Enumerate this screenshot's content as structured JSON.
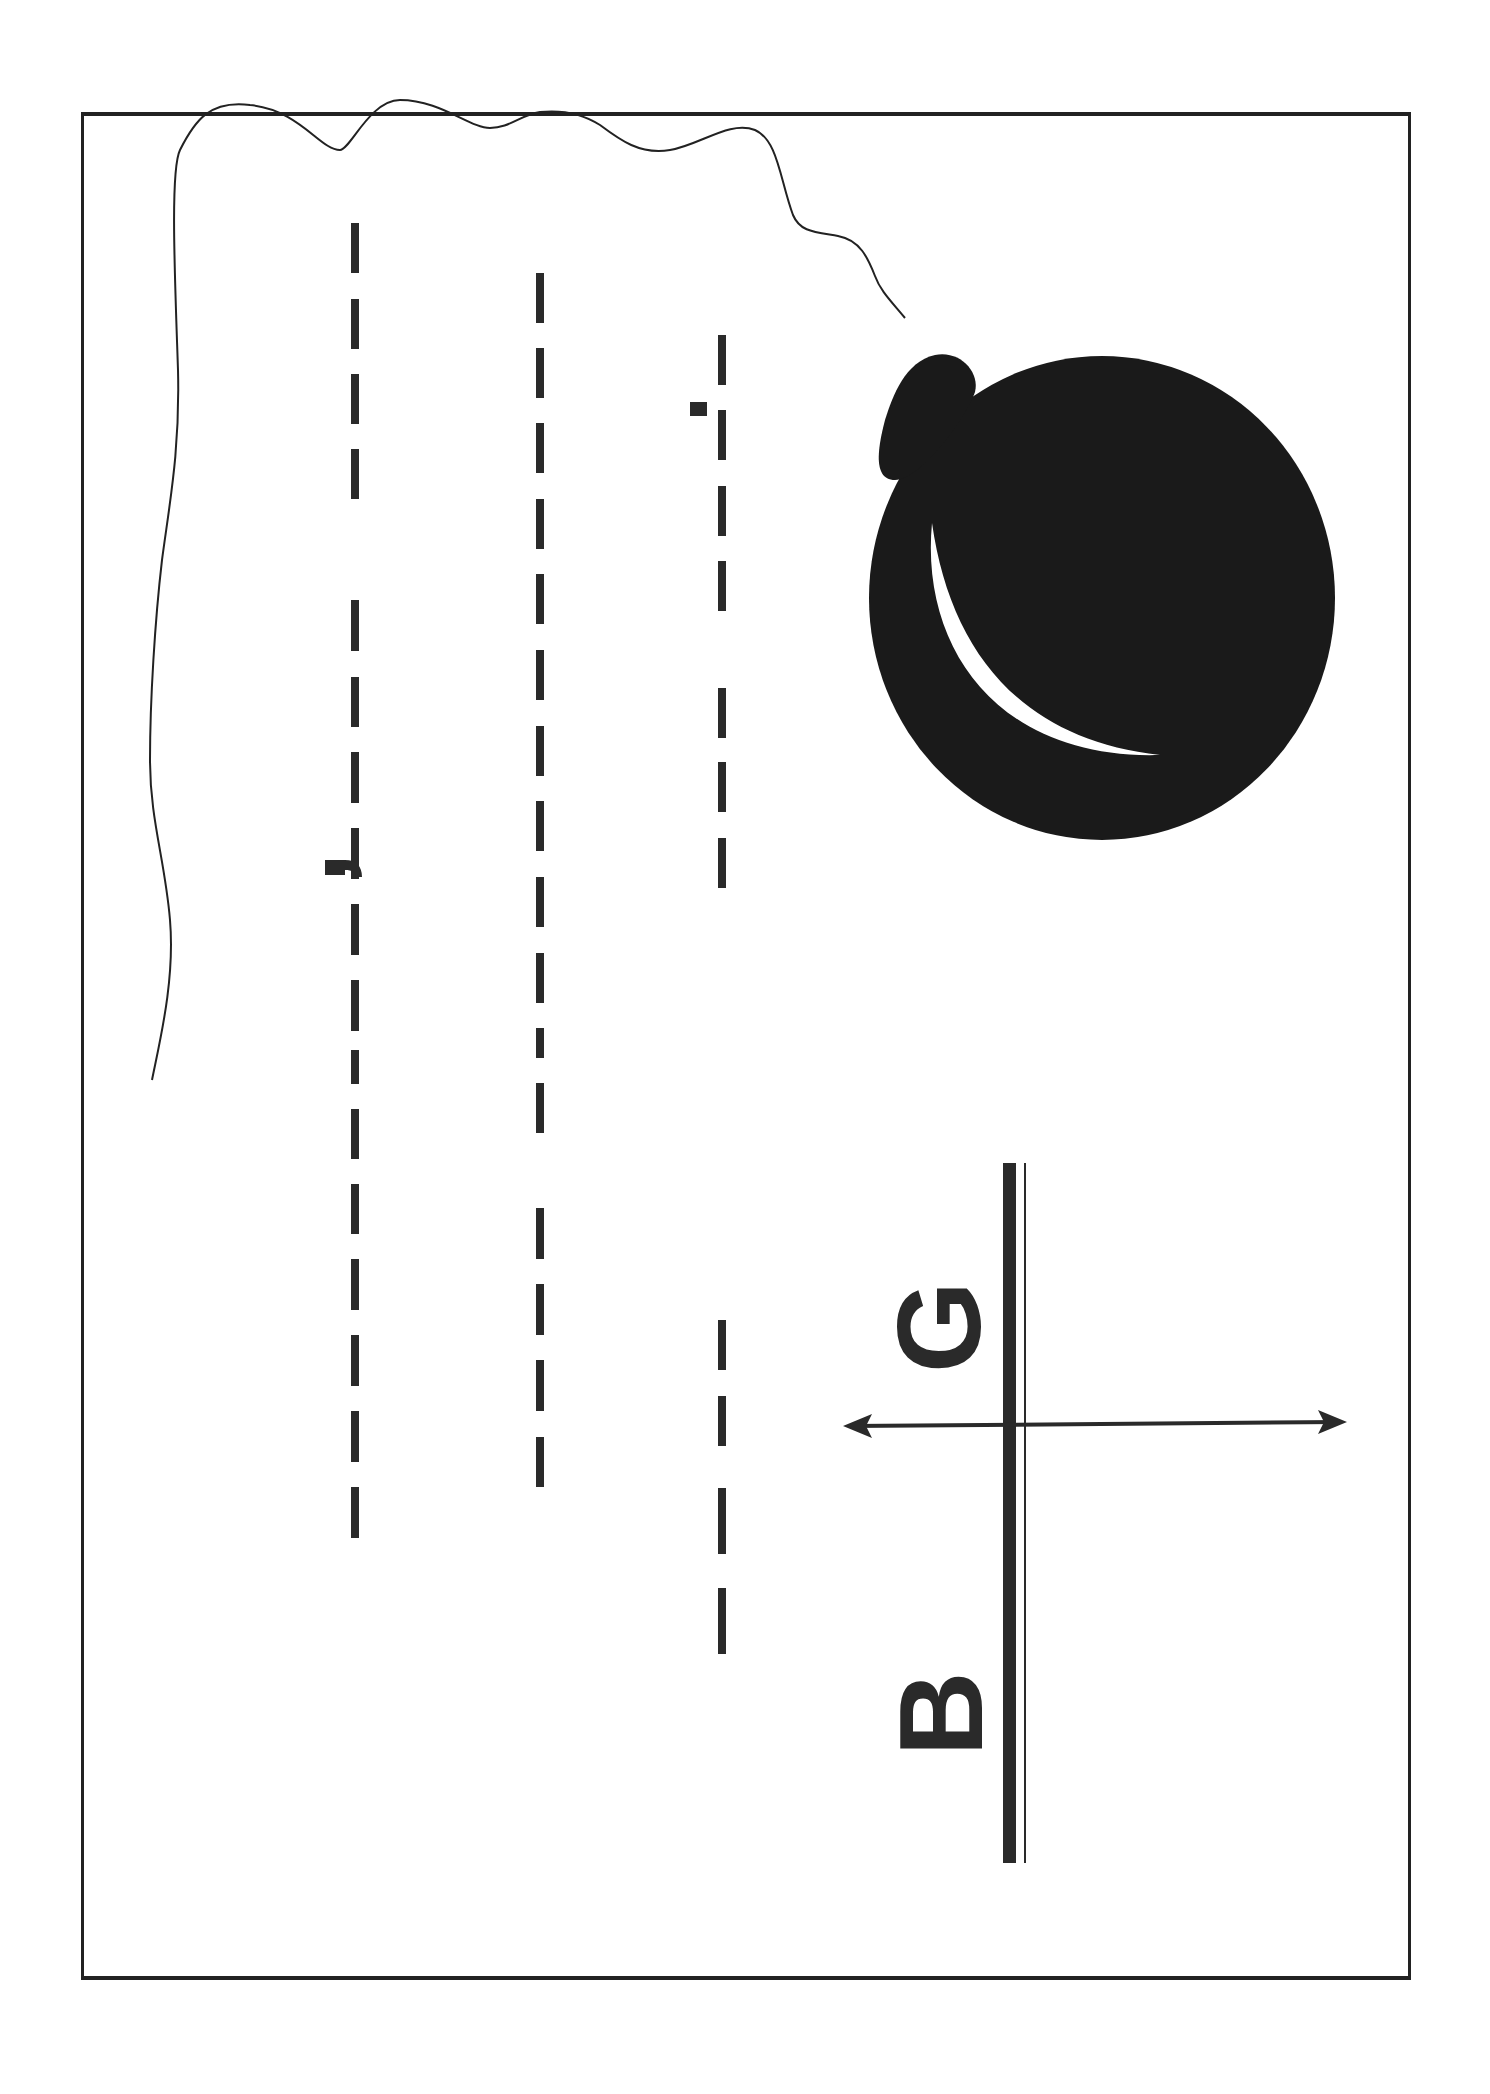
{
  "worksheet": {
    "orientation": "rotated-90",
    "ink_color": "#222222",
    "illustration": "balloon-with-string",
    "tracing_lines": [
      {
        "id": "line-1",
        "x": 355,
        "mark": "hook",
        "dashes": [
          [
            223,
            273
          ],
          [
            299,
            349
          ],
          [
            374,
            424
          ],
          [
            449,
            499
          ],
          [
            600,
            651
          ],
          [
            677,
            727
          ],
          [
            752,
            803
          ],
          [
            828,
            879
          ],
          [
            904,
            955
          ],
          [
            980,
            1031
          ],
          [
            1050,
            1084
          ],
          [
            1109,
            1159
          ],
          [
            1184,
            1234
          ],
          [
            1259,
            1310
          ],
          [
            1335,
            1386
          ],
          [
            1411,
            1462
          ],
          [
            1487,
            1538
          ]
        ]
      },
      {
        "id": "line-2",
        "x": 540,
        "dashes": [
          [
            273,
            323
          ],
          [
            348,
            398
          ],
          [
            423,
            473
          ],
          [
            499,
            549
          ],
          [
            574,
            624
          ],
          [
            650,
            700
          ],
          [
            726,
            776
          ],
          [
            801,
            851
          ],
          [
            877,
            927
          ],
          [
            953,
            1003
          ],
          [
            1028,
            1058
          ],
          [
            1083,
            1133
          ],
          [
            1208,
            1259
          ],
          [
            1284,
            1335
          ],
          [
            1360,
            1411
          ],
          [
            1437,
            1487
          ]
        ]
      },
      {
        "id": "line-3",
        "x": 722,
        "mark": "dot",
        "dashes": [
          [
            335,
            385
          ],
          [
            410,
            460
          ],
          [
            486,
            536
          ],
          [
            561,
            611
          ],
          [
            688,
            738
          ],
          [
            762,
            812
          ],
          [
            838,
            888
          ],
          [
            1320,
            1370
          ],
          [
            1396,
            1446
          ],
          [
            1488,
            1554
          ],
          [
            1588,
            1654
          ]
        ]
      }
    ],
    "axis_labels": {
      "left": "B",
      "right": "G"
    }
  }
}
